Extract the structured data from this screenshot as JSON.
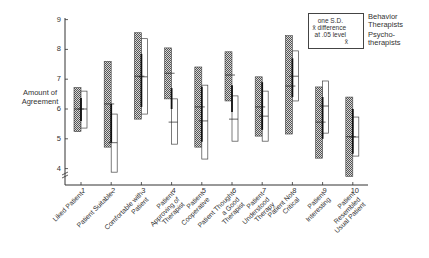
{
  "chart_data": {
    "type": "box-range",
    "title": "",
    "ylabel": "Amount of Agreement",
    "xlabel": "",
    "ylim": [
      3.5,
      9
    ],
    "yticks": [
      "4",
      "5",
      "6",
      "7",
      "8",
      "9"
    ],
    "categories": [
      {
        "num": "1",
        "label": "Liked Patient"
      },
      {
        "num": "2",
        "label": "Patient Suitable"
      },
      {
        "num": "3",
        "label": "Comfortable with Patient"
      },
      {
        "num": "4",
        "label": "Patient Approving of Therapist"
      },
      {
        "num": "5",
        "label": "Patient Cooperative"
      },
      {
        "num": "6",
        "label": "Patient Thought a Good Therapist"
      },
      {
        "num": "7",
        "label": "Patient Understood Therapy"
      },
      {
        "num": "8",
        "label": "Patient Not Critical"
      },
      {
        "num": "9",
        "label": "Patient Interesting"
      },
      {
        "num": "10",
        "label": "Patient Resembled Usual Patient"
      }
    ],
    "series": [
      {
        "name": "Behavior Therapists",
        "style": "hatched",
        "sd_top": [
          6.72,
          7.6,
          8.56,
          8.05,
          7.41,
          7.92,
          7.08,
          8.46,
          6.74,
          6.4
        ],
        "sd_bottom": [
          5.24,
          4.72,
          5.66,
          6.34,
          4.72,
          6.27,
          5.09,
          5.16,
          4.35,
          3.74
        ],
        "mean": [
          6.0,
          6.17,
          7.1,
          7.2,
          6.07,
          7.14,
          6.07,
          6.77,
          5.56,
          5.07
        ]
      },
      {
        "name": "Psychotherapists",
        "style": "open",
        "sd_top": [
          6.6,
          5.83,
          8.36,
          6.34,
          6.8,
          6.44,
          6.6,
          7.95,
          6.94,
          5.73
        ],
        "sd_bottom": [
          5.36,
          3.88,
          5.83,
          4.82,
          4.32,
          4.92,
          4.92,
          6.27,
          5.19,
          4.42
        ],
        "mean": [
          6.0,
          4.87,
          7.08,
          5.56,
          5.6,
          5.66,
          5.76,
          7.1,
          6.1,
          5.06
        ]
      }
    ],
    "diff_bar": {
      "label": "x̄ difference at .05 level",
      "top": [
        6.37,
        6.17,
        7.85,
        6.7,
        6.75,
        6.8,
        6.9,
        7.7,
        6.4,
        6.0
      ],
      "bottom": [
        5.6,
        4.87,
        6.07,
        6.0,
        4.9,
        5.9,
        5.3,
        6.4,
        5.0,
        4.5
      ]
    },
    "legend": {
      "position": "top-right",
      "sd_label": "one S.D.",
      "diff_label_1": "x̄ difference",
      "diff_label_2": "at .05 level",
      "mean_label": "x̄",
      "series_1_line1": "Behavior",
      "series_1_line2": "Therapists",
      "series_2_line1": "Psycho-",
      "series_2_line2": "therapists"
    },
    "grid": false
  }
}
